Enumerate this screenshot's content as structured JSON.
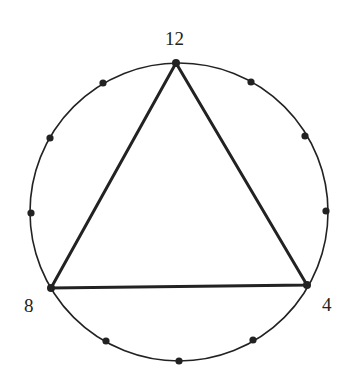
{
  "diagram": {
    "title": "",
    "circle": {
      "cx": 179,
      "cy": 212,
      "r": 149
    },
    "colors": {
      "stroke": "#222222",
      "background": "#ffffff"
    },
    "labels": [
      {
        "text": "12",
        "x": 165,
        "y": 29
      },
      {
        "text": "8",
        "x": 24,
        "y": 296
      },
      {
        "text": "4",
        "x": 322,
        "y": 295
      }
    ],
    "points": [
      {
        "position": 12,
        "x": 176,
        "y": 63,
        "vertex": true
      },
      {
        "position": 1,
        "x": 251,
        "y": 82
      },
      {
        "position": 2,
        "x": 305,
        "y": 136
      },
      {
        "position": 3,
        "x": 326,
        "y": 211
      },
      {
        "position": 4,
        "x": 307,
        "y": 285,
        "vertex": true
      },
      {
        "position": 5,
        "x": 253,
        "y": 340
      },
      {
        "position": 6,
        "x": 179,
        "y": 361
      },
      {
        "position": 7,
        "x": 106,
        "y": 341
      },
      {
        "position": 8,
        "x": 51,
        "y": 288,
        "vertex": true
      },
      {
        "position": 9,
        "x": 31,
        "y": 213
      },
      {
        "position": 10,
        "x": 50,
        "y": 138
      },
      {
        "position": 11,
        "x": 103,
        "y": 83
      }
    ],
    "triangle": [
      12,
      4,
      8
    ]
  }
}
